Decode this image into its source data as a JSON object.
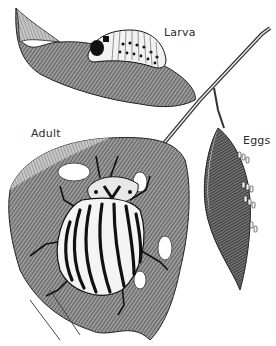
{
  "figure": {
    "style": "black-and-white pen-and-ink illustration",
    "colors": {
      "background": "#ffffff",
      "ink": "#1a1a1a",
      "leaf_shade": "#6b6b6b",
      "label_text": "#2a2a2a"
    },
    "labels": {
      "larva": "Larva",
      "adult": "Adult",
      "eggs": "Eggs"
    }
  }
}
